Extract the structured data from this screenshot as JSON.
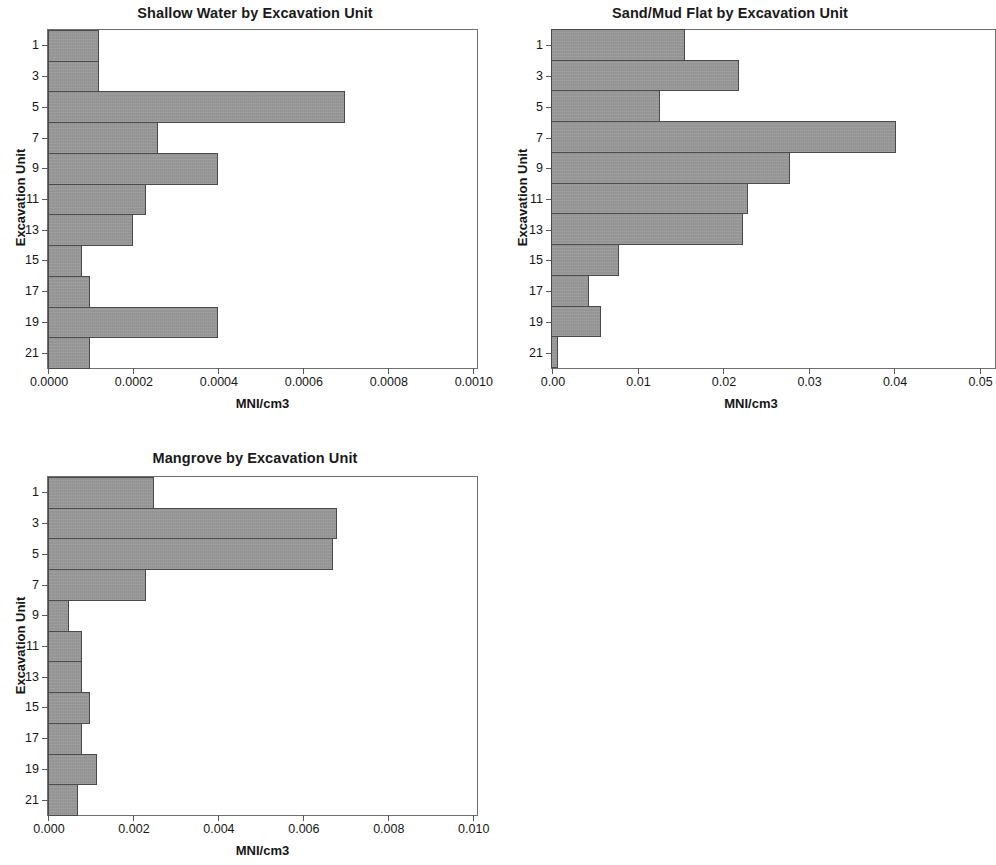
{
  "figure": {
    "background_color": "#ffffff",
    "bar_fill_color": "#9a9a9a",
    "bar_border_color": "#4a4a4a",
    "axis_color": "#6f6f6f"
  },
  "chart_data": [
    {
      "type": "bar",
      "orientation": "horizontal",
      "title": "Shallow Water by Excavation Unit",
      "xlabel": "MNI/cm3",
      "ylabel": "Excavation Unit",
      "categories": [
        "1",
        "2",
        "3",
        "4",
        "5",
        "6",
        "7",
        "8",
        "9",
        "10",
        "11"
      ],
      "ytick_labels": [
        "1",
        "3",
        "5",
        "7",
        "9",
        "11",
        "13",
        "15",
        "17",
        "19",
        "21"
      ],
      "values": [
        0.00012,
        0.00012,
        0.0007,
        0.00026,
        0.0004,
        0.00023,
        0.0002,
        8e-05,
        0.0001,
        0.0004,
        0.0001
      ],
      "xlim": [
        0.0,
        0.00101
      ],
      "xticks": [
        0.0,
        0.0002,
        0.0004,
        0.0006,
        0.0008,
        0.001
      ],
      "xtick_labels": [
        "0.0000",
        "0.0002",
        "0.0004",
        "0.0006",
        "0.0008",
        "0.0010"
      ],
      "grid": false,
      "legend": null
    },
    {
      "type": "bar",
      "orientation": "horizontal",
      "title": "Sand/Mud Flat by Excavation Unit",
      "xlabel": "MNI/cm3",
      "ylabel": "Excavation Unit",
      "categories": [
        "1",
        "2",
        "3",
        "4",
        "5",
        "6",
        "7",
        "8",
        "9",
        "10",
        "11"
      ],
      "ytick_labels": [
        "1",
        "3",
        "5",
        "7",
        "9",
        "11",
        "13",
        "15",
        "17",
        "19",
        "21"
      ],
      "values": [
        0.0157,
        0.022,
        0.0128,
        0.0403,
        0.028,
        0.023,
        0.0225,
        0.008,
        0.0045,
        0.0058,
        0.0008
      ],
      "xlim": [
        0.0,
        0.0518
      ],
      "xticks": [
        0.0,
        0.01,
        0.02,
        0.03,
        0.04,
        0.05
      ],
      "xtick_labels": [
        "0.00",
        "0.01",
        "0.02",
        "0.03",
        "0.04",
        "0.05"
      ],
      "grid": false,
      "legend": null
    },
    {
      "type": "bar",
      "orientation": "horizontal",
      "title": "Mangrove by Excavation Unit",
      "xlabel": "MNI/cm3",
      "ylabel": "Excavation Unit",
      "categories": [
        "1",
        "2",
        "3",
        "4",
        "5",
        "6",
        "7",
        "8",
        "9",
        "10",
        "11"
      ],
      "ytick_labels": [
        "1",
        "3",
        "5",
        "7",
        "9",
        "11",
        "13",
        "15",
        "17",
        "19",
        "21"
      ],
      "values": [
        0.0025,
        0.0068,
        0.0067,
        0.0023,
        0.0005,
        0.0008,
        0.0008,
        0.001,
        0.0008,
        0.00115,
        0.0007
      ],
      "xlim": [
        0.0,
        0.0101
      ],
      "xticks": [
        0.0,
        0.002,
        0.004,
        0.006,
        0.008,
        0.01
      ],
      "xtick_labels": [
        "0.000",
        "0.002",
        "0.004",
        "0.006",
        "0.008",
        "0.010"
      ],
      "grid": false,
      "legend": null
    }
  ]
}
